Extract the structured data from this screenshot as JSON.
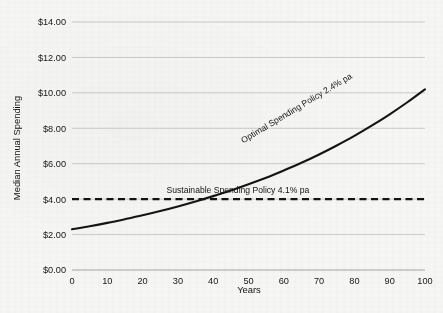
{
  "chart_data": {
    "type": "line",
    "title": "",
    "xlabel": "Years",
    "ylabel": "Median Annual Spending",
    "xlim": [
      0,
      100
    ],
    "ylim": [
      0,
      14
    ],
    "grid": true,
    "legend_position": "inline-annotations",
    "x_ticks": [
      0,
      10,
      20,
      30,
      40,
      50,
      60,
      70,
      80,
      90,
      100
    ],
    "x_tick_labels": [
      "0",
      "10",
      "20",
      "30",
      "40",
      "50",
      "60",
      "70",
      "80",
      "90",
      "100"
    ],
    "y_ticks": [
      0,
      2,
      4,
      6,
      8,
      10,
      12,
      14
    ],
    "y_tick_labels": [
      "$0.00",
      "$2.00",
      "$4.00",
      "$6.00",
      "$8.00",
      "$10.00",
      "$12.00",
      "$14.00"
    ],
    "series": [
      {
        "name": "Optimal Spending Policy 2.4% pa",
        "style": "solid",
        "color": "#141414",
        "x": [
          0,
          5,
          10,
          15,
          20,
          25,
          30,
          35,
          40,
          45,
          50,
          55,
          60,
          65,
          70,
          75,
          80,
          85,
          90,
          95,
          100
        ],
        "values": [
          2.3,
          2.47,
          2.66,
          2.87,
          3.09,
          3.33,
          3.59,
          3.87,
          4.17,
          4.49,
          4.84,
          5.21,
          5.62,
          6.05,
          6.52,
          7.03,
          7.57,
          8.16,
          8.79,
          9.47,
          10.2
        ]
      },
      {
        "name": "Sustainable Spending Policy 4.1% pa",
        "style": "dashed",
        "color": "#131313",
        "x": [
          0,
          100
        ],
        "values": [
          4.0,
          4.0
        ]
      }
    ],
    "annotations": [
      {
        "text": "Optimal Spending Policy 2.4% pa",
        "rotation_deg": -31,
        "anchor_x": 64,
        "anchor_y": 9.0
      },
      {
        "text": "Sustainable Spending Policy 4.1% pa",
        "rotation_deg": 0,
        "anchor_x": 47,
        "anchor_y": 4.35
      }
    ]
  }
}
